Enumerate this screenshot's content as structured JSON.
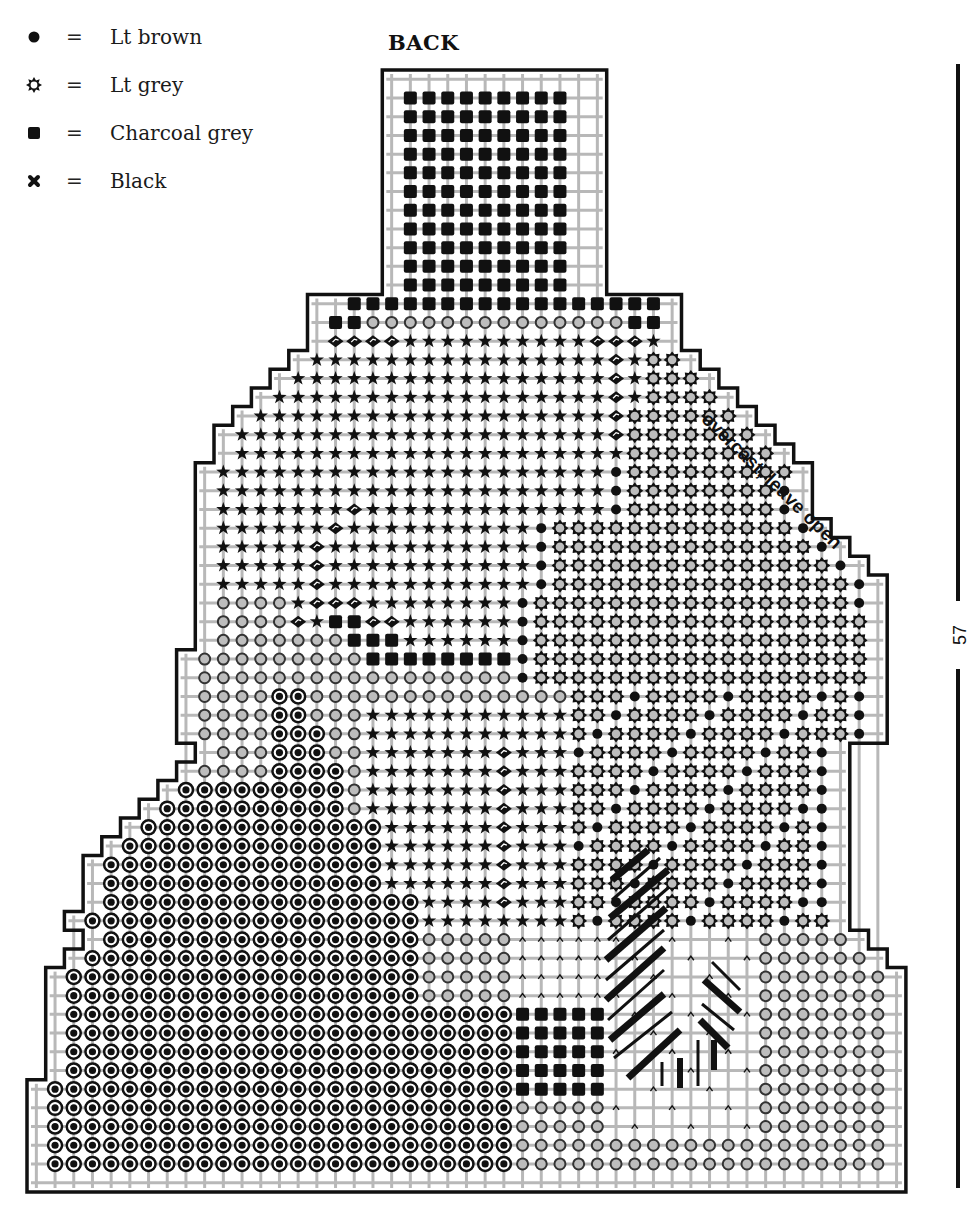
{
  "title": "BACK",
  "legend": [
    {
      "symbol": "lt-brown-dot",
      "eq": "=",
      "label": "Lt brown"
    },
    {
      "symbol": "lt-grey-gear",
      "eq": "=",
      "label": "Lt grey"
    },
    {
      "symbol": "charcoal-square",
      "eq": "=",
      "label": "Charcoal grey"
    },
    {
      "symbol": "black-cross",
      "eq": "=",
      "label": "Black"
    }
  ],
  "dimension": {
    "label": "57 bars"
  },
  "annotation": {
    "text": "overcast, leave open"
  },
  "colors": {
    "ink": "#111111",
    "grid": "#b8b8b8",
    "fill_grey": "#bdbdbd",
    "paper": "#ffffff"
  },
  "grid": {
    "x0": 27,
    "y0": 70,
    "cell": 18.7,
    "cols": 47,
    "rows": 60
  }
}
